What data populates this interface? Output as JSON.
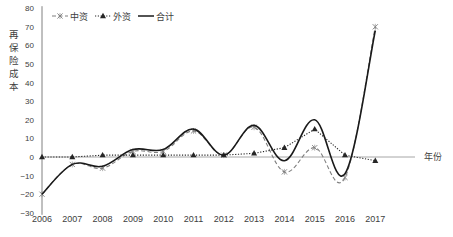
{
  "chart_data": {
    "type": "line",
    "title": "",
    "xlabel": "年份",
    "ylabel": "再保险成本",
    "ylim": [
      -30,
      80
    ],
    "yticks": [
      -30,
      -20,
      -10,
      0,
      10,
      20,
      30,
      40,
      50,
      60,
      70,
      80
    ],
    "grid": false,
    "legend_position": "top-left",
    "categories": [
      "2006",
      "2007",
      "2008",
      "2009",
      "2010",
      "2011",
      "2012",
      "2013",
      "2014",
      "2015",
      "2016",
      "2017"
    ],
    "series": [
      {
        "name": "中资",
        "style": "dashed",
        "marker": "x",
        "color": "#7f7f7f",
        "values": [
          -20,
          -4,
          -6,
          3,
          3,
          14,
          1,
          16,
          -8,
          5,
          -11,
          70
        ]
      },
      {
        "name": "外资",
        "style": "dotted",
        "marker": "triangle",
        "color": "#262626",
        "values": [
          0,
          0,
          1,
          1,
          1,
          1,
          1,
          2,
          5,
          15,
          1,
          -2
        ]
      },
      {
        "name": "合计",
        "style": "solid",
        "marker": "none",
        "color": "#1a1a1a",
        "values": [
          -20,
          -4,
          -5,
          4,
          4,
          15,
          1,
          17,
          -2,
          20,
          -9,
          68
        ]
      }
    ]
  },
  "labels": {
    "ylabel": "再保险成本",
    "xlabel": "年份"
  }
}
